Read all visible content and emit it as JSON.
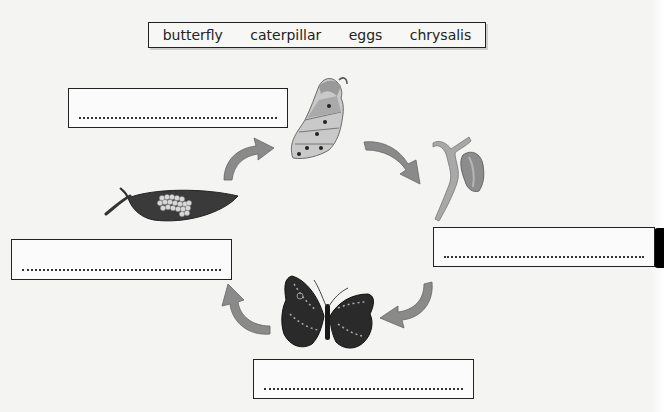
{
  "worksheet": {
    "topic": "butterfly life cycle",
    "word_bank": {
      "words": [
        "butterfly",
        "caterpillar",
        "eggs",
        "chrysalis"
      ]
    },
    "answer_boxes": [
      {
        "position": "top-left",
        "next_to": "caterpillar",
        "value": "",
        "placeholder": "..............................................."
      },
      {
        "position": "right",
        "next_to": "chrysalis",
        "value": "",
        "placeholder": "..............................................."
      },
      {
        "position": "bottom",
        "next_to": "butterfly",
        "value": "",
        "placeholder": "..............................................."
      },
      {
        "position": "left",
        "next_to": "eggs",
        "value": "",
        "placeholder": "..............................................."
      }
    ],
    "illustrations": [
      "caterpillar",
      "chrysalis",
      "butterfly",
      "eggs-on-leaf"
    ],
    "arrows": [
      "eggs-to-caterpillar",
      "caterpillar-to-chrysalis",
      "chrysalis-to-butterfly",
      "butterfly-to-eggs"
    ],
    "colors": {
      "box_border": "#222222",
      "arrow": "#8a8a8a",
      "leaf": "#3a3a3a",
      "butterfly": "#2a2a2a"
    }
  }
}
